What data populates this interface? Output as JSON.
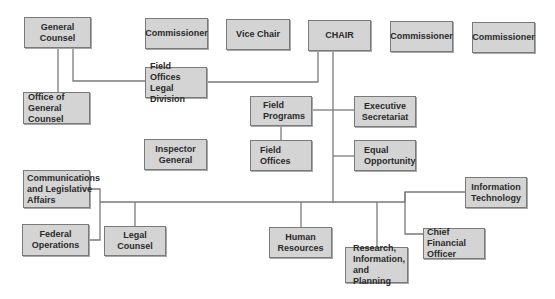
{
  "colors": {
    "box_fill": "#d4d4d4",
    "box_border": "#7a7a7a",
    "line": "#7a7a7a",
    "background": "#ffffff"
  },
  "boxes": {
    "general_counsel": "General Counsel",
    "commissioner_1": "Commissioner",
    "vice_chair": "Vice Chair",
    "chair": "CHAIR",
    "commissioner_2": "Commissioner",
    "commissioner_3": "Commissioner",
    "field_offices_legal_division": "Field Offices\nLegal Division",
    "office_of_general_counsel": "Office of\nGeneral Counsel",
    "field_programs": "Field\nPrograms",
    "executive_secretariat": "Executive\nSecretariat",
    "inspector_general": "Inspector\nGeneral",
    "field_offices": "Field\nOffices",
    "equal_opportunity": "Equal\nOpportunity",
    "communications_legislative_affairs": "Communications\nand Legislative\nAffairs",
    "information_technology": "Information\nTechnology",
    "federal_operations": "Federal\nOperations",
    "legal_counsel": "Legal Counsel",
    "human_resources": "Human\nResources",
    "chief_financial_officer": "Chief\nFinancial Officer",
    "research_information_planning": "Research,\nInformation,\nand Planning"
  }
}
